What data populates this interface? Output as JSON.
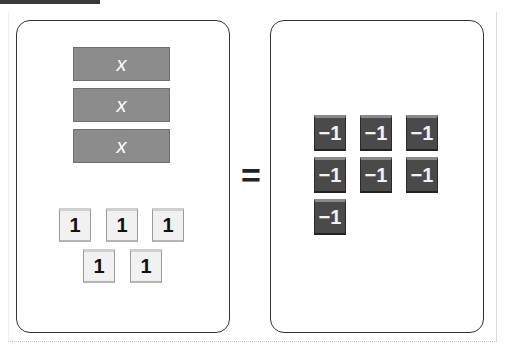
{
  "equation": {
    "left_side": {
      "x_tiles": [
        {
          "label": "x",
          "top": 47
        },
        {
          "label": "x",
          "top": 88
        },
        {
          "label": "x",
          "top": 129
        }
      ],
      "unit_tiles": [
        {
          "label": "1",
          "left": 59,
          "top": 208
        },
        {
          "label": "1",
          "left": 106,
          "top": 208
        },
        {
          "label": "1",
          "left": 152,
          "top": 208
        },
        {
          "label": "1",
          "left": 83,
          "top": 249
        },
        {
          "label": "1",
          "left": 130,
          "top": 249
        }
      ]
    },
    "operator": "=",
    "right_side": {
      "negative_unit_tiles": [
        {
          "label": "−1",
          "left": 314,
          "top": 115
        },
        {
          "label": "−1",
          "left": 360,
          "top": 115
        },
        {
          "label": "−1",
          "left": 406,
          "top": 115
        },
        {
          "label": "−1",
          "left": 314,
          "top": 157
        },
        {
          "label": "−1",
          "left": 360,
          "top": 157
        },
        {
          "label": "−1",
          "left": 406,
          "top": 157
        },
        {
          "label": "−1",
          "left": 314,
          "top": 199
        }
      ]
    }
  },
  "colors": {
    "x_tile": "#8c8c8c",
    "unit_tile": "#f1f1f1",
    "negative_tile": "#4a4a4a",
    "panel_border": "#333333"
  }
}
